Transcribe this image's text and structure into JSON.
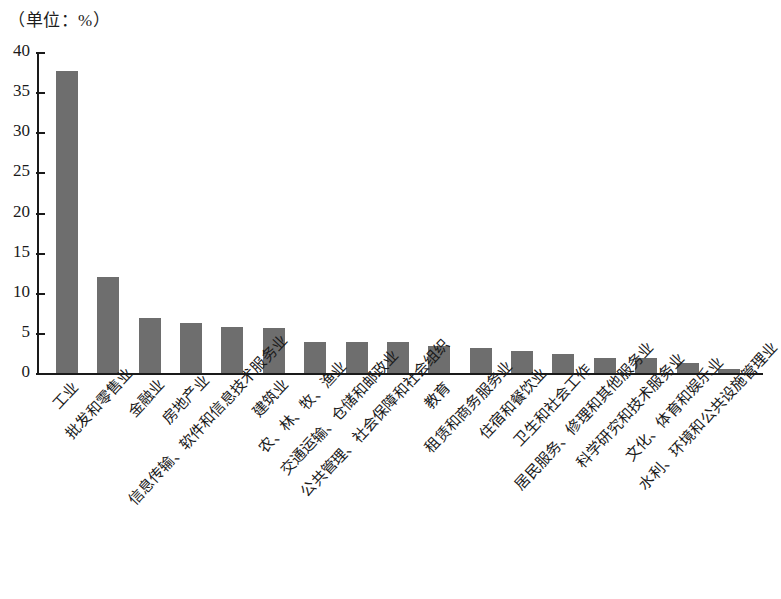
{
  "caption": "（单位：%）",
  "chart_data": {
    "type": "bar",
    "title": "",
    "subtitle": "",
    "xlabel": "",
    "ylabel": "",
    "unit_note": "（单位：%）",
    "ylim": [
      0,
      40
    ],
    "ytick_labels": [
      "0",
      "5",
      "10",
      "15",
      "20",
      "25",
      "30",
      "35",
      "40"
    ],
    "ytick_values": [
      0,
      5,
      10,
      15,
      20,
      25,
      30,
      35,
      40
    ],
    "grid": false,
    "legend": null,
    "bar_color": "#6e6e6e",
    "axis_color": "#1a1a1a",
    "categories": [
      "工业",
      "批发和零售业",
      "金融业",
      "房地产业",
      "信息传输、软件和信息技术服务业",
      "建筑业",
      "农、林、牧、渔业",
      "交通运输、仓储和邮政业",
      "公共管理、社会保障和社会组织",
      "教育",
      "租赁和商务服务业",
      "住宿和餐饮业",
      "卫生和社会工作",
      "居民服务、修理和其他服务业",
      "科学研究和技术服务业",
      "文化、体育和娱乐业",
      "水利、环境和公共设施管理业"
    ],
    "values": [
      37.6,
      12.0,
      6.8,
      6.2,
      5.7,
      5.6,
      3.9,
      3.9,
      3.9,
      3.4,
      3.1,
      2.7,
      2.4,
      1.9,
      1.9,
      1.2,
      0.5
    ]
  }
}
